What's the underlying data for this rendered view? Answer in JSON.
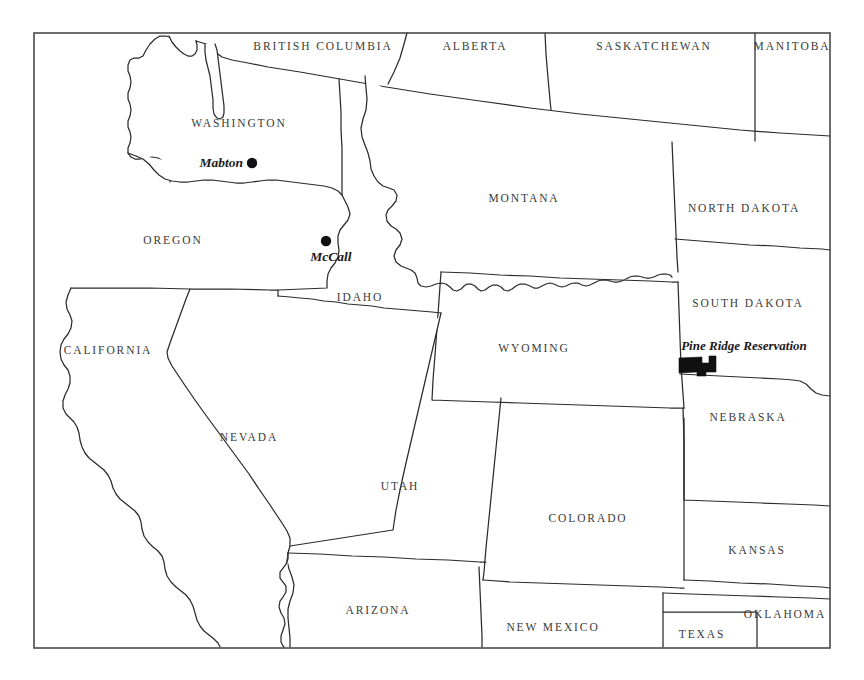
{
  "map": {
    "title": "Western United States reference map",
    "background_color": "#ffffff",
    "line_color": "#2b2b2b",
    "frame_color": "#4a4a4a",
    "label_color": "#3a3a3a",
    "marker_color": "#111111",
    "frame": {
      "x": 34,
      "y": 33,
      "width": 796,
      "height": 615
    },
    "provinces": [
      {
        "id": "british-columbia",
        "name": "BRITISH COLUMBIA",
        "label_x": 323,
        "label_y": 47
      },
      {
        "id": "alberta",
        "name": "ALBERTA",
        "label_x": 475,
        "label_y": 47
      },
      {
        "id": "saskatchewan",
        "name": "SASKATCHEWAN",
        "label_x": 654,
        "label_y": 47
      },
      {
        "id": "manitoba",
        "name": "MANITOBA",
        "label_x": 792,
        "label_y": 47
      }
    ],
    "states": [
      {
        "id": "washington",
        "name": "WASHINGTON",
        "label_x": 239,
        "label_y": 124
      },
      {
        "id": "montana",
        "name": "MONTANA",
        "label_x": 524,
        "label_y": 199
      },
      {
        "id": "north-dakota",
        "name": "NORTH DAKOTA",
        "label_x": 744,
        "label_y": 209
      },
      {
        "id": "oregon",
        "name": "OREGON",
        "label_x": 173,
        "label_y": 241
      },
      {
        "id": "idaho",
        "name": "IDAHO",
        "label_x": 360,
        "label_y": 298
      },
      {
        "id": "south-dakota",
        "name": "SOUTH DAKOTA",
        "label_x": 748,
        "label_y": 304
      },
      {
        "id": "wyoming",
        "name": "WYOMING",
        "label_x": 534,
        "label_y": 349
      },
      {
        "id": "california",
        "name": "CALIFORNIA",
        "label_x": 108,
        "label_y": 351
      },
      {
        "id": "nebraska",
        "name": "NEBRASKA",
        "label_x": 748,
        "label_y": 418
      },
      {
        "id": "nevada",
        "name": "NEVADA",
        "label_x": 249,
        "label_y": 438
      },
      {
        "id": "utah",
        "name": "UTAH",
        "label_x": 400,
        "label_y": 487
      },
      {
        "id": "colorado",
        "name": "COLORADO",
        "label_x": 588,
        "label_y": 519
      },
      {
        "id": "kansas",
        "name": "KANSAS",
        "label_x": 757,
        "label_y": 551
      },
      {
        "id": "arizona",
        "name": "ARIZONA",
        "label_x": 378,
        "label_y": 611
      },
      {
        "id": "oklahoma",
        "name": "OKLAHOMA",
        "label_x": 785,
        "label_y": 615
      },
      {
        "id": "new-mexico",
        "name": "NEW MEXICO",
        "label_x": 553,
        "label_y": 628
      },
      {
        "id": "texas",
        "name": "TEXAS",
        "label_x": 702,
        "label_y": 635
      }
    ],
    "cities": [
      {
        "id": "mabton",
        "name": "Mabton",
        "label_x": 243,
        "label_y": 164,
        "dot_x": 252,
        "dot_y": 163,
        "dot_r": 5.2,
        "anchor": "end"
      },
      {
        "id": "mccall",
        "name": "McCall",
        "label_x": 331,
        "label_y": 258,
        "dot_x": 326,
        "dot_y": 241,
        "dot_r": 5.2,
        "anchor": "middle"
      }
    ],
    "reservations": [
      {
        "id": "pine-ridge",
        "name": "Pine Ridge Reservation",
        "label_x": 744,
        "label_y": 347,
        "shape_x": 679,
        "shape_y": 356
      }
    ]
  }
}
